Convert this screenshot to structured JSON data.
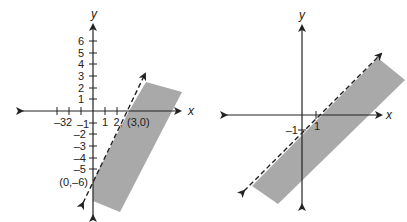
{
  "graphs": [
    {
      "id": "left",
      "axis_labels": {
        "x": "x",
        "y": "y"
      },
      "x_ticks": [
        "-3",
        "-2",
        "-1",
        "1",
        "2"
      ],
      "y_ticks_pos": [
        "1",
        "2",
        "3",
        "4",
        "5",
        "6"
      ],
      "y_ticks_neg": [
        "-1",
        "-2",
        "-3",
        "-4",
        "-5"
      ],
      "points": [
        {
          "label": "(3,0)",
          "x": 3,
          "y": 0
        },
        {
          "label": "(0,–6)",
          "x": 0,
          "y": -6
        }
      ],
      "boundary": {
        "style": "dashed",
        "equation": "y = 2x - 6"
      },
      "shaded_side": "below-right",
      "shade_color": "#a9a9a9"
    },
    {
      "id": "right",
      "axis_labels": {
        "x": "x",
        "y": "y"
      },
      "x_ticks": [
        "1"
      ],
      "y_ticks": [
        "–1"
      ],
      "boundary": {
        "style": "dashed",
        "equation": "y = x - 1"
      },
      "shaded_side": "below-right",
      "shade_color": "#a9a9a9"
    }
  ],
  "labels": {
    "left_x_tick_m3": "–3",
    "left_x_tick_m2": "2",
    "left_x_tick_m1": "–1",
    "left_x_tick_1": "1",
    "left_x_tick_2": "2,",
    "left_point_30": "(3,0)",
    "left_point_0m6": "(0,–6)",
    "left_y6": "6",
    "left_y5": "5",
    "left_y4": "4",
    "left_y3": "3",
    "left_y2": "2",
    "left_y1": "1",
    "left_ym2": "–2",
    "left_ym3": "–3",
    "left_ym4": "–4",
    "left_ym5": "–5",
    "left_x": "x",
    "left_y": "y",
    "right_x": "x",
    "right_y": "y",
    "right_x1": "1",
    "right_ym1": "–1"
  }
}
